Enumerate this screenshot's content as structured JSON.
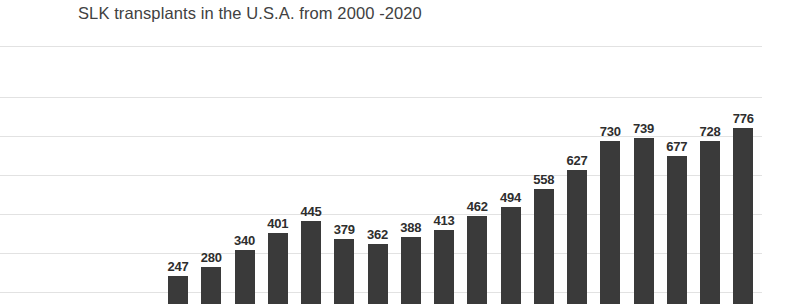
{
  "chart": {
    "title": "SLK transplants in the U.S.A. from 2000 -2020"
  },
  "style": {
    "bar_color": "#3a3a3a",
    "gridline_color": "#e2e2e2",
    "title_color": "#414141",
    "label_color": "#2e2e2e",
    "background": "#ffffff"
  },
  "chart_data": {
    "type": "bar",
    "title": "SLK transplants in the U.S.A. from 2000 -2020",
    "xlabel": "",
    "ylabel": "",
    "grid": true,
    "legend": false,
    "ylim": [
      0,
      800
    ],
    "categories": [
      "2000",
      "2001",
      "2002",
      "2003",
      "2004",
      "2005",
      "2006",
      "2007",
      "2008",
      "2009",
      "2010",
      "2011",
      "2012",
      "2013",
      "2014",
      "2015",
      "2016",
      "2017"
    ],
    "values": [
      247,
      280,
      340,
      401,
      445,
      379,
      362,
      388,
      413,
      462,
      494,
      558,
      627,
      730,
      739,
      677,
      728,
      776
    ],
    "data_labels": [
      "247",
      "280",
      "340",
      "401",
      "445",
      "379",
      "362",
      "388",
      "413",
      "462",
      "494",
      "558",
      "627",
      "730",
      "739",
      "677",
      "728",
      "776"
    ],
    "note": "Image is cropped at the bottom; category axis tick labels and the zero baseline are not visible in this view."
  }
}
